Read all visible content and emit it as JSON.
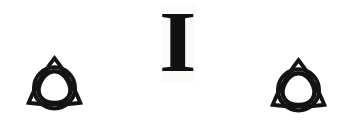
{
  "canvas": {
    "width": 344,
    "height": 124,
    "background_color": "#ffffff"
  },
  "ink_color": "#141414",
  "letter": {
    "character": "I",
    "style": "bold-serif-capital",
    "patch_color": "#fbfbfa"
  },
  "symbols": [
    {
      "name": "triquetra-left",
      "label": "triquetra",
      "description": "trinity knot with encircling ring",
      "color": "#141414"
    },
    {
      "name": "triquetra-right",
      "label": "triquetra",
      "description": "trinity knot with encircling ring",
      "color": "#141414"
    }
  ]
}
